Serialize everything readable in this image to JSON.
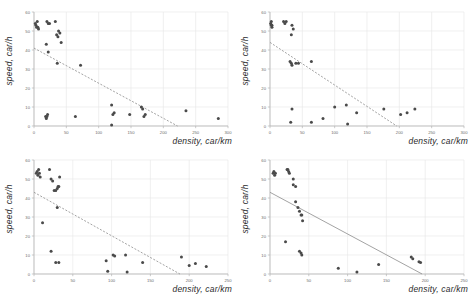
{
  "figure": {
    "width": 473,
    "height": 297,
    "background": "#ffffff",
    "panel_count": 4,
    "marker_color": "#4a4a4a",
    "gridline_color": "#e6e6e6",
    "axis_color": "#b4b4b4",
    "trendline_color": "#8c8c8c"
  },
  "chart_data": [
    {
      "type": "scatter",
      "title": "",
      "xlabel": "density, car/km",
      "ylabel": "speed, car/h",
      "xlim": [
        0,
        300
      ],
      "ylim": [
        0,
        60
      ],
      "xticks": [
        0,
        50,
        100,
        150,
        200,
        250,
        300
      ],
      "yticks": [
        0,
        10,
        20,
        30,
        40,
        50,
        60
      ],
      "grid": true,
      "legend": "none",
      "x": [
        2,
        3,
        4,
        5,
        6,
        7,
        20,
        22,
        24,
        33,
        35,
        37,
        38,
        40,
        42,
        19,
        22,
        18,
        19,
        20,
        21,
        36,
        64,
        72,
        120,
        122,
        124,
        148,
        166,
        168,
        170,
        172,
        120,
        235,
        285
      ],
      "y": [
        54,
        53,
        52,
        55,
        52,
        51,
        55,
        54,
        54,
        55,
        48,
        47,
        50,
        49,
        44,
        43,
        39,
        5,
        4,
        5,
        6,
        33,
        5,
        32,
        11,
        6,
        7,
        6,
        10,
        9,
        5,
        6,
        0.5,
        8,
        4
      ],
      "trendline": {
        "x0": 0,
        "y0": 41,
        "x1": 222,
        "y1": 0,
        "style": "dashed"
      }
    },
    {
      "type": "scatter",
      "title": "",
      "xlabel": "density, car/km",
      "ylabel": "speed, car/h",
      "xlim": [
        0,
        300
      ],
      "ylim": [
        0,
        60
      ],
      "xticks": [
        0,
        50,
        100,
        150,
        200,
        250,
        300
      ],
      "yticks": [
        0,
        10,
        20,
        30,
        40,
        50,
        60
      ],
      "grid": true,
      "legend": "none",
      "x": [
        1,
        2,
        2,
        3,
        3,
        21,
        23,
        25,
        33,
        34,
        36,
        31,
        33,
        34,
        40,
        44,
        64,
        34,
        32,
        64,
        82,
        100,
        118,
        120,
        134,
        176,
        202,
        212,
        224
      ],
      "y": [
        54,
        55,
        53,
        53,
        52,
        55,
        54,
        55,
        48,
        53,
        51,
        34,
        33,
        32,
        33,
        33,
        34,
        9,
        2,
        2,
        4,
        10,
        11,
        1,
        7,
        9,
        6,
        7,
        9
      ],
      "trendline": {
        "x0": 0,
        "y0": 44,
        "x1": 196,
        "y1": 0,
        "style": "dashed"
      }
    },
    {
      "type": "scatter",
      "title": "",
      "xlabel": "density, car/km",
      "ylabel": "speed, car/h",
      "xlim": [
        0,
        250
      ],
      "ylim": [
        0,
        60
      ],
      "xticks": [
        0,
        50,
        100,
        150,
        200,
        250
      ],
      "yticks": [
        0,
        10,
        20,
        30,
        40,
        50,
        60
      ],
      "grid": true,
      "legend": "none",
      "x": [
        3,
        4,
        5,
        6,
        7,
        8,
        20,
        22,
        24,
        26,
        28,
        30,
        31,
        32,
        33,
        30,
        11,
        22,
        28,
        32,
        93,
        95,
        102,
        104,
        118,
        120,
        140,
        190,
        200,
        208,
        222
      ],
      "y": [
        53,
        54,
        52,
        55,
        53,
        51,
        55,
        50,
        49,
        44,
        44,
        45,
        46,
        46,
        51,
        35,
        27,
        12,
        6,
        6,
        7,
        1.5,
        10,
        9.5,
        10,
        1,
        6,
        9,
        4.5,
        5.5,
        4
      ],
      "trendline": {
        "x0": 0,
        "y0": 43,
        "x1": 188,
        "y1": 0,
        "style": "dashed"
      }
    },
    {
      "type": "scatter",
      "title": "",
      "xlabel": "density, car/km",
      "ylabel": "speed, car/h",
      "xlim": [
        0,
        250
      ],
      "ylim": [
        0,
        60
      ],
      "xticks": [
        0,
        50,
        100,
        150,
        200,
        250
      ],
      "yticks": [
        0,
        10,
        20,
        30,
        40,
        50,
        60
      ],
      "grid": true,
      "legend": "none",
      "x": [
        4,
        5,
        6,
        7,
        22,
        23,
        24,
        25,
        30,
        33,
        30,
        33,
        36,
        38,
        40,
        41,
        42,
        20,
        38,
        40,
        41,
        88,
        112,
        140,
        182,
        184,
        192,
        194
      ],
      "y": [
        53,
        54,
        52,
        53,
        55,
        55,
        54,
        53,
        50,
        46,
        47,
        38,
        35,
        33,
        31,
        31,
        28,
        17,
        12,
        11,
        10,
        3,
        1,
        5,
        9,
        8,
        6.5,
        6
      ],
      "trendline": {
        "x0": 0,
        "y0": 43,
        "x1": 196,
        "y1": 0,
        "style": "solid"
      }
    }
  ]
}
